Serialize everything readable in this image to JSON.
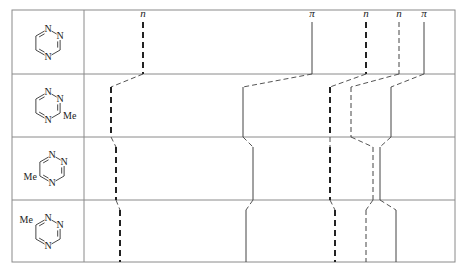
{
  "table": {
    "left": 12,
    "right": 455,
    "top": 10,
    "bottom": 262,
    "divider_x": 84,
    "row_bounds": [
      10,
      74,
      137,
      200,
      262
    ],
    "border_color": "#8a8a8a",
    "line_color": "#333333"
  },
  "rows": [
    {
      "name": "1,2,4-triazine",
      "substituent": "",
      "substituent_position": "none",
      "atoms": {
        "n1": "N",
        "n2": "N",
        "n4": "N"
      }
    },
    {
      "name": "3-methyl-1,2,4-triazine",
      "substituent": "Me",
      "substituent_position": "3"
    },
    {
      "name": "5-methyl-1,2,4-triazine",
      "substituent": "Me",
      "substituent_position": "5"
    },
    {
      "name": "6-methyl-1,2,4-triazine",
      "substituent": "Me",
      "substituent_position": "6"
    }
  ],
  "levels": [
    {
      "label": "n",
      "type": "n",
      "style": "bold-dashed",
      "x": [
        143,
        111,
        116,
        120
      ]
    },
    {
      "label": "π",
      "type": "pi",
      "style": "solid",
      "x": [
        312,
        243,
        253,
        246
      ]
    },
    {
      "label": "n",
      "type": "n",
      "style": "bold-dashed",
      "x": [
        366,
        330,
        330,
        335
      ]
    },
    {
      "label": "n",
      "type": "n",
      "style": "thin-dashed",
      "x": [
        399,
        351,
        373,
        366
      ]
    },
    {
      "label": "π",
      "type": "pi",
      "style": "solid",
      "x": [
        424,
        391,
        380,
        396
      ]
    }
  ],
  "legend": {
    "n_label": "n",
    "pi_label": "π",
    "methyl_label": "Me",
    "nitrogen_label": "N"
  }
}
